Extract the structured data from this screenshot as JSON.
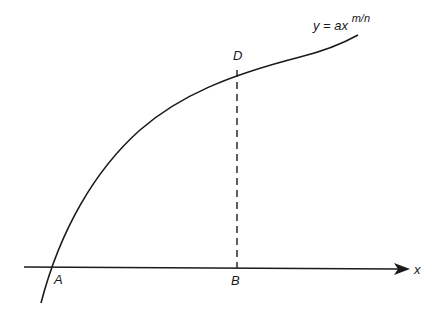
{
  "diagram": {
    "curve_label": {
      "base": "y = ax",
      "exponent": "m/n"
    },
    "axis_label": "x",
    "points": {
      "A": "A",
      "B": "B",
      "D": "D"
    },
    "colors": {
      "ink": "#1a1a1a",
      "background": "#ffffff"
    }
  }
}
